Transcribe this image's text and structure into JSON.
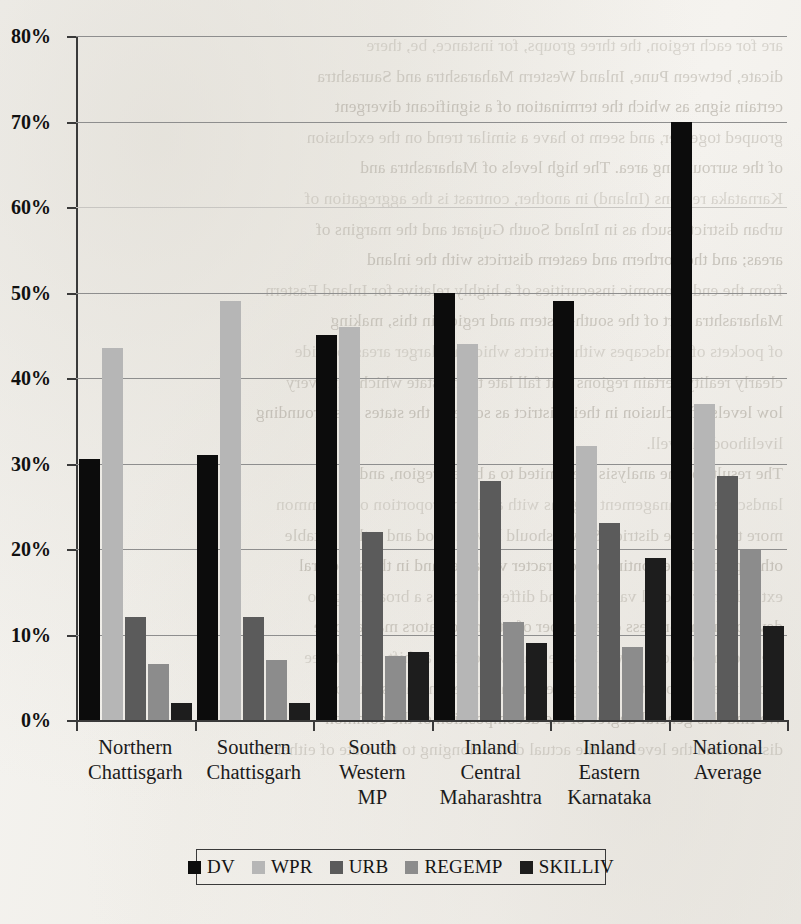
{
  "chart_data": {
    "type": "bar",
    "title": "",
    "xlabel": "",
    "ylabel": "",
    "ylim": [
      0,
      80
    ],
    "grid": true,
    "legend_position": "bottom",
    "ytick_labels": [
      "0%",
      "10%",
      "20%",
      "30%",
      "40%",
      "50%",
      "60%",
      "70%",
      "80%"
    ],
    "ytick_values": [
      0,
      10,
      20,
      30,
      40,
      50,
      60,
      70,
      80
    ],
    "categories": [
      "Northern Chattisgarh",
      "Southern Chattisgarh",
      "South Western MP",
      "Inland Central Maharashtra",
      "Inland Eastern Karnataka",
      "National Average"
    ],
    "category_lines": [
      [
        "Northern",
        "Chattisgarh"
      ],
      [
        "Southern",
        "Chattisgarh"
      ],
      [
        "South",
        "Western",
        "MP"
      ],
      [
        "Inland",
        "Central",
        "Maharashtra"
      ],
      [
        "Inland",
        "Eastern",
        "Karnataka"
      ],
      [
        "National",
        "Average"
      ]
    ],
    "series": [
      {
        "name": "DV",
        "color": "#0c0c0c",
        "values": [
          30.5,
          31.0,
          45.0,
          50.0,
          49.0,
          70.0
        ]
      },
      {
        "name": "WPR",
        "color": "#b6b6b6",
        "values": [
          43.5,
          49.0,
          46.0,
          44.0,
          32.0,
          37.0
        ]
      },
      {
        "name": "URB",
        "color": "#5b5b5b",
        "values": [
          12.0,
          12.0,
          22.0,
          28.0,
          23.0,
          28.5
        ]
      },
      {
        "name": "REGEMP",
        "color": "#8c8c8c",
        "values": [
          6.5,
          7.0,
          7.5,
          11.5,
          8.5,
          20.0
        ]
      },
      {
        "name": "SKILLIV",
        "color": "#1d1d1d",
        "values": [
          2.0,
          2.0,
          8.0,
          9.0,
          19.0,
          11.0
        ]
      }
    ]
  },
  "legend": {
    "items": [
      {
        "label": "DV",
        "color": "#0c0c0c"
      },
      {
        "label": "WPR",
        "color": "#b6b6b6"
      },
      {
        "label": "URB",
        "color": "#5b5b5b"
      },
      {
        "label": "REGEMP",
        "color": "#8c8c8c"
      },
      {
        "label": "SKILLIV",
        "color": "#1d1d1d"
      }
    ]
  },
  "background_text": {
    "note": "faded mirrored bleed-through text from reverse side of scanned page",
    "lines": [
      "are for each region, the three groups, for instance, be, there",
      "dicate, between Pune, Inland Western Maharashtra and Saurashtra",
      "certain signs as which the termination of a significant divergent",
      "grouped together, and seem to have a similar trend on the exclusion",
      "of the surrounding area.       The high levels of Maharashtra and",
      "Karnataka regions (Inland) in another, contrast is the aggregation of",
      "urban   districts, such as in Inland South Gujarat and the margins of",
      "areas; and the northern and eastern districts with the inland",
      "from the end economic insecurities of a highly relative for Inland Eastern",
      "Maharashtra part of the south-eastern and region in this, making",
      "of pockets of landscapes with districts which are larger areas, outside",
      "clearly reality certain regions that fall late to the state which have very",
      "low levels of inclusion in their district as some of the states of surrounding",
      "livelihoods as well.",
      "The results of the analysis are limited to a broad region, and",
      "landscape or management regions with a given proportion of a common",
      "more to be in the district. So we should have a good and rather notable",
      "other parts of the continuous character variables and in the structural",
      "extends the regional variation, and different across a broad range to",
      "develop in the process of a number of other indicators may also be",
      "are and the broader as well as the state which has a shift to the three",
      "substantially broad the local government and economic status of",
      "We find this general degree of the decomposition of the common",
      "districts and the level that the actual data belonging to the state of either a"
    ]
  }
}
